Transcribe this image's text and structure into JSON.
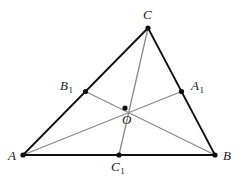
{
  "figure": {
    "background_color": "#ffffff",
    "side_color": "#101010",
    "median_color": "#8a8a8a",
    "point_color": "#101010",
    "side_width": 1.8,
    "median_width": 1.3,
    "point_radius": 2.6
  },
  "points": {
    "A": {
      "label": "A",
      "sub": "",
      "x": 23,
      "y": 155,
      "label_x": 8,
      "label_y": 149
    },
    "B": {
      "label": "B",
      "sub": "",
      "x": 215,
      "y": 155,
      "label_x": 223,
      "label_y": 149
    },
    "C": {
      "label": "C",
      "sub": "",
      "x": 148,
      "y": 28,
      "label_x": 143,
      "label_y": 8
    },
    "A1": {
      "label": "A",
      "sub": "1",
      "x": 181.5,
      "y": 91.5,
      "label_x": 191,
      "label_y": 79
    },
    "B1": {
      "label": "B",
      "sub": "1",
      "x": 85.5,
      "y": 91.5,
      "label_x": 60,
      "label_y": 79
    },
    "C1": {
      "label": "C",
      "sub": "1",
      "x": 119,
      "y": 155,
      "label_x": 111,
      "label_y": 160
    },
    "O": {
      "label": "O",
      "sub": "",
      "x": 125,
      "y": 108,
      "label_x": 122,
      "label_y": 113
    }
  },
  "sides": [
    {
      "name": "side-AB",
      "from": "A",
      "to": "B"
    },
    {
      "name": "side-AC",
      "from": "A",
      "to": "C"
    },
    {
      "name": "side-BC",
      "from": "B",
      "to": "C"
    }
  ],
  "medians": [
    {
      "name": "median-A-A1",
      "from": "A",
      "to": "A1"
    },
    {
      "name": "median-B-B1",
      "from": "B",
      "to": "B1"
    },
    {
      "name": "median-C-C1",
      "from": "C",
      "to": "C1"
    }
  ],
  "point_order": [
    "A",
    "B",
    "C",
    "A1",
    "B1",
    "C1",
    "O"
  ]
}
